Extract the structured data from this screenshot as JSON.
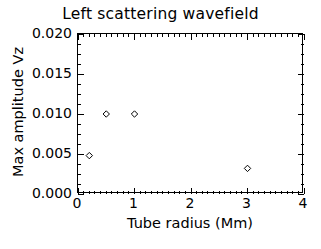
{
  "chart_data": {
    "type": "scatter",
    "title": "Left scattering wavefield",
    "xlabel": "Tube radius (Mm)",
    "ylabel": "Max amplitude Vz",
    "xlim": [
      0,
      4
    ],
    "ylim": [
      0.0,
      0.02
    ],
    "grid": false,
    "legend": null,
    "marker": "open-diamond",
    "marker_color": "#000000",
    "x": [
      0.2,
      0.5,
      1.0,
      3.0
    ],
    "y": [
      0.0048,
      0.01,
      0.01,
      0.0032
    ],
    "points": [
      {
        "x": 0.2,
        "y": 0.0048
      },
      {
        "x": 0.5,
        "y": 0.01
      },
      {
        "x": 1.0,
        "y": 0.01
      },
      {
        "x": 3.0,
        "y": 0.0032
      }
    ],
    "xticks": [
      0,
      1,
      2,
      3,
      4
    ],
    "xtick_labels": [
      "0",
      "1",
      "2",
      "3",
      "4"
    ],
    "yticks": [
      0.0,
      0.005,
      0.01,
      0.015,
      0.02
    ],
    "ytick_labels": [
      "0.000",
      "0.005",
      "0.010",
      "0.015",
      "0.020"
    ],
    "x_minor_ticks_per_interval": 10,
    "y_minor_ticks_per_interval": 4
  },
  "colors": {
    "background": "#ffffff",
    "ink": "#000000"
  }
}
